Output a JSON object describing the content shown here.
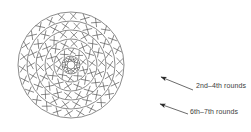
{
  "figure": {
    "type": "crochet-round-chart",
    "background_color": "#ffffff",
    "line_color": "#555555",
    "text_color": "#3c3c3c",
    "stitch_symbol": "X",
    "center": {
      "cx": 71,
      "cy": 65,
      "hub_radius": 4,
      "spokes": 8
    },
    "rings": [
      {
        "index": 1,
        "radius": 9,
        "stitch_count": 8
      },
      {
        "index": 2,
        "radius": 17,
        "stitch_count": 10
      },
      {
        "index": 3,
        "radius": 26,
        "stitch_count": 14
      },
      {
        "index": 4,
        "radius": 35,
        "stitch_count": 18
      },
      {
        "index": 5,
        "radius": 44,
        "stitch_count": 22
      },
      {
        "index": 6,
        "radius": 53,
        "stitch_count": 26
      }
    ]
  },
  "annotations": [
    {
      "id": "upper",
      "label": "2nd–4th rounds",
      "arrow": {
        "tail_x": 193,
        "tail_y": 90,
        "head_x": 158,
        "head_y": 76
      }
    },
    {
      "id": "lower",
      "label": "6th–7th rounds",
      "arrow": {
        "tail_x": 188,
        "tail_y": 114,
        "head_x": 157,
        "head_y": 103
      }
    }
  ]
}
